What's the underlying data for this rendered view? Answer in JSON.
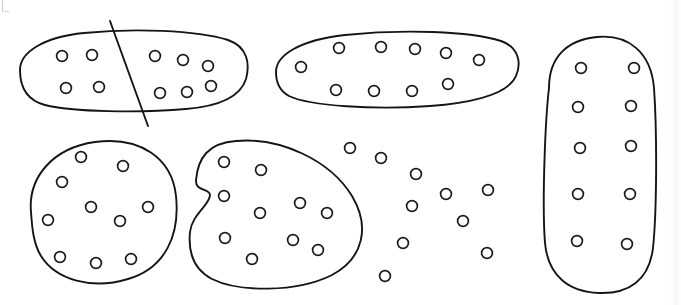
{
  "scene": {
    "title": "Hand-drawn circle grouping worksheet",
    "background_color": "#ffffff",
    "ink_color": "#1a1a1a",
    "circle_fill": "#ffffff",
    "width": 681,
    "height": 305,
    "total_circles": 60,
    "groups_count": 5,
    "circles_per_group": 10,
    "loose_circles_count": 10,
    "divider_lines_count": 1
  },
  "circle_style": {
    "radius": 5.4,
    "stroke_width": 1.7,
    "stroke_color": "#1c1c1c",
    "fill_color": "#ffffff"
  },
  "blob_style": {
    "stroke_width": 1.9,
    "stroke_color": "#151515",
    "fill_color": "none"
  },
  "groups": [
    {
      "name": "top-left-group",
      "label": "Group 1",
      "count": 10,
      "outline": "M 20 70 C 20 52, 44 37, 84 33 C 132 28, 196 30, 228 40 C 248 47, 250 64, 246 79 C 241 95, 222 106, 186 109 C 140 113, 72 112, 45 105 C 26 100, 20 86, 20 70 Z",
      "circles": [
        {
          "cx": 62,
          "cy": 56
        },
        {
          "cx": 92,
          "cy": 55
        },
        {
          "cx": 66,
          "cy": 88
        },
        {
          "cx": 99,
          "cy": 87
        },
        {
          "cx": 155,
          "cy": 56
        },
        {
          "cx": 183,
          "cy": 60
        },
        {
          "cx": 208,
          "cy": 66
        },
        {
          "cx": 160,
          "cy": 93
        },
        {
          "cx": 187,
          "cy": 92
        },
        {
          "cx": 211,
          "cy": 86
        }
      ]
    },
    {
      "name": "top-middle-group",
      "label": "Group 2",
      "count": 10,
      "outline": "M 276 72 C 276 55, 300 40, 345 35 C 402 29, 470 31, 501 41 C 518 47, 522 62, 516 76 C 509 92, 482 102, 430 106 C 374 110, 310 106, 289 96 C 278 90, 276 81, 276 72 Z",
      "circles": [
        {
          "cx": 301,
          "cy": 67
        },
        {
          "cx": 339,
          "cy": 48
        },
        {
          "cx": 381,
          "cy": 47
        },
        {
          "cx": 415,
          "cy": 49
        },
        {
          "cx": 446,
          "cy": 53
        },
        {
          "cx": 479,
          "cy": 60
        },
        {
          "cx": 336,
          "cy": 90
        },
        {
          "cx": 374,
          "cy": 91
        },
        {
          "cx": 412,
          "cy": 91
        },
        {
          "cx": 448,
          "cy": 84
        }
      ]
    },
    {
      "name": "right-tall-group",
      "label": "Group 3",
      "count": 10,
      "outline": "M 549 88 C 549 58, 566 40, 597 37 C 628 34, 651 52, 654 88 C 657 130, 657 210, 653 248 C 649 281, 628 294, 599 293 C 569 292, 548 276, 545 243 C 542 205, 545 122, 549 88 Z",
      "circles": [
        {
          "cx": 581,
          "cy": 68
        },
        {
          "cx": 634,
          "cy": 68
        },
        {
          "cx": 578,
          "cy": 107
        },
        {
          "cx": 631,
          "cy": 106
        },
        {
          "cx": 580,
          "cy": 148
        },
        {
          "cx": 631,
          "cy": 146
        },
        {
          "cx": 578,
          "cy": 194
        },
        {
          "cx": 630,
          "cy": 194
        },
        {
          "cx": 577,
          "cy": 241
        },
        {
          "cx": 627,
          "cy": 244
        }
      ]
    },
    {
      "name": "bottom-left-group",
      "label": "Group 4",
      "count": 10,
      "outline": "M 31 212 C 28 178, 52 148, 95 142 C 140 136, 172 158, 176 196 C 180 234, 166 268, 128 279 C 92 290, 56 280, 41 256 C 33 243, 32 226, 31 212 Z",
      "circles": [
        {
          "cx": 81,
          "cy": 157
        },
        {
          "cx": 123,
          "cy": 166
        },
        {
          "cx": 62,
          "cy": 182
        },
        {
          "cx": 91,
          "cy": 207
        },
        {
          "cx": 148,
          "cy": 207
        },
        {
          "cx": 48,
          "cy": 220
        },
        {
          "cx": 120,
          "cy": 221
        },
        {
          "cx": 60,
          "cy": 257
        },
        {
          "cx": 96,
          "cy": 263
        },
        {
          "cx": 131,
          "cy": 259
        }
      ]
    },
    {
      "name": "bottom-middle-group",
      "label": "Group 5",
      "count": 10,
      "outline": "M 196 180 C 198 158, 208 143, 236 141 C 280 137, 330 160, 352 196 C 370 226, 364 258, 332 275 C 296 293, 238 292, 212 279 C 193 269, 188 252, 190 232 C 192 214, 210 205, 210 195 C 210 188, 195 192, 196 180 Z",
      "circles": [
        {
          "cx": 224,
          "cy": 162
        },
        {
          "cx": 261,
          "cy": 170
        },
        {
          "cx": 224,
          "cy": 196
        },
        {
          "cx": 260,
          "cy": 213
        },
        {
          "cx": 300,
          "cy": 203
        },
        {
          "cx": 327,
          "cy": 213
        },
        {
          "cx": 225,
          "cy": 238
        },
        {
          "cx": 293,
          "cy": 240
        },
        {
          "cx": 318,
          "cy": 250
        },
        {
          "cx": 252,
          "cy": 259
        }
      ]
    }
  ],
  "loose_circles": {
    "name": "ungrouped-circles",
    "label": "Loose circles",
    "count": 10,
    "circles": [
      {
        "cx": 350,
        "cy": 148
      },
      {
        "cx": 381,
        "cy": 158
      },
      {
        "cx": 416,
        "cy": 174
      },
      {
        "cx": 446,
        "cy": 194
      },
      {
        "cx": 488,
        "cy": 190
      },
      {
        "cx": 412,
        "cy": 206
      },
      {
        "cx": 463,
        "cy": 221
      },
      {
        "cx": 403,
        "cy": 243
      },
      {
        "cx": 487,
        "cy": 253
      },
      {
        "cx": 385,
        "cy": 276
      }
    ]
  },
  "divider_lines": [
    {
      "name": "divider-line-top-left",
      "label": "Dividing line",
      "x1": 110,
      "y1": 21,
      "x2": 148,
      "y2": 126
    }
  ],
  "marks": {
    "corner_mark_label": "corner crop mark",
    "page_edge_label": "page edge shadow"
  }
}
